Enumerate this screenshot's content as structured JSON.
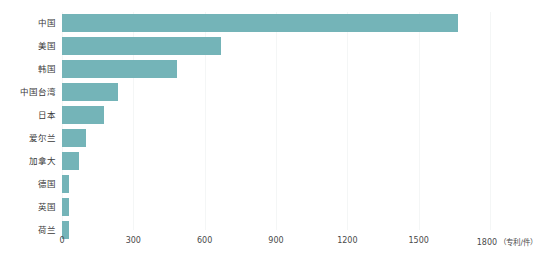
{
  "chart_data": {
    "type": "bar",
    "orientation": "horizontal",
    "title": "",
    "xlabel": "",
    "ylabel": "",
    "unit_label": "（专利/件）",
    "xlim": [
      0,
      1800
    ],
    "xticks": [
      0,
      300,
      600,
      900,
      1200,
      1500,
      1800
    ],
    "xtick_labels": [
      "0",
      "300",
      "600",
      "900",
      "1200",
      "1500",
      "1800"
    ],
    "grid": true,
    "legend": false,
    "bar_color": "#74b4b8",
    "categories": [
      "中国",
      "美国",
      "韩国",
      "中国台湾",
      "日本",
      "爱尔兰",
      "加拿大",
      "德国",
      "英国",
      "荷兰"
    ],
    "values": [
      1665,
      670,
      485,
      235,
      175,
      100,
      72,
      28,
      28,
      28
    ]
  }
}
